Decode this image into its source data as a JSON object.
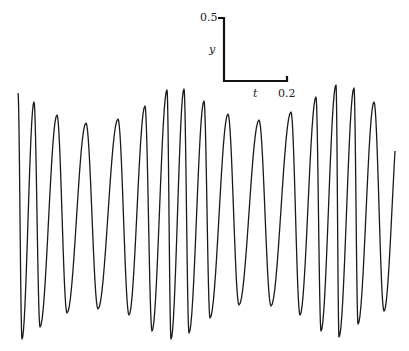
{
  "chart_data": {
    "type": "line",
    "title": "",
    "xlabel": "t",
    "ylabel": "y",
    "grid": false,
    "legend": null,
    "line_color": "#1a1a1a",
    "background": "#ffffff",
    "scale_bar": {
      "y_label": "y",
      "y_value_label": "0.5",
      "y_length": 0.5,
      "t_label": "t",
      "t_value_label": "0.2",
      "t_length": 0.2
    },
    "extrema": {
      "description": "Alternating maxima and minima of an oscillating signal y(t), t measured from left edge of the trace, y relative to midline",
      "t": [
        0.0,
        0.013,
        0.051,
        0.057,
        0.124,
        0.098,
        0.216,
        0.254,
        0.317,
        0.352,
        0.403,
        0.425,
        0.472,
        0.486,
        0.527,
        0.54,
        0.587,
        0.61,
        0.667,
        0.702,
        0.765,
        0.803,
        0.867,
        0.895,
        0.946,
        0.962,
        1.01,
        1.019,
        1.076,
        1.13,
        1.197
      ],
      "y": [
        0.956,
        -0.992,
        0.889,
        -0.897,
        0.786,
        -0.786,
        0.722,
        -0.754,
        0.754,
        -0.801,
        0.857,
        -0.921,
        0.984,
        -0.992,
        0.992,
        -0.944,
        0.897,
        -0.825,
        0.794,
        -0.73,
        0.746,
        -0.73,
        0.81,
        -0.802,
        0.929,
        -0.929,
        1.032,
        -0.976,
        1.008,
        -0.881,
        0.357
      ]
    },
    "peaks_px": [
      [
        18,
        93
      ],
      [
        34,
        102
      ],
      [
        57,
        115
      ],
      [
        86,
        123
      ],
      [
        118,
        119
      ],
      [
        145,
        106
      ],
      [
        167,
        90
      ],
      [
        184,
        89
      ],
      [
        204,
        101
      ],
      [
        228,
        114
      ],
      [
        259,
        120
      ],
      [
        291,
        112
      ],
      [
        316,
        97
      ],
      [
        336,
        85
      ],
      [
        354,
        88
      ],
      [
        374,
        102
      ]
    ],
    "troughs_px": [
      [
        22,
        339
      ],
      [
        40,
        327
      ],
      [
        67,
        313
      ],
      [
        98,
        309
      ],
      [
        129,
        315
      ],
      [
        152,
        331
      ],
      [
        171,
        339
      ],
      [
        189,
        333
      ],
      [
        210,
        318
      ],
      [
        239,
        305
      ],
      [
        271,
        306
      ],
      [
        300,
        315
      ],
      [
        321,
        331
      ],
      [
        339,
        337
      ],
      [
        358,
        324
      ],
      [
        384,
        311
      ]
    ],
    "end_px": [
      395,
      169
    ],
    "midline_px": 214,
    "px_per_y_unit": 126,
    "px_per_t_unit": 315
  }
}
